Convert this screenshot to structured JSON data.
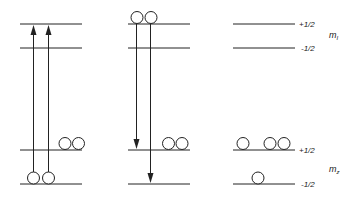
{
  "diagram": {
    "type": "energy-level-diagram",
    "panels": [
      {
        "id": "absorption",
        "levels_y": [
          24,
          48,
          150,
          184
        ],
        "arrows": [
          {
            "direction": "up",
            "from": "bottom",
            "to": "top"
          },
          {
            "direction": "up",
            "from": "bottom",
            "to": "top"
          }
        ],
        "particles": {
          "level_3": 2,
          "level_4": 2
        }
      },
      {
        "id": "emission",
        "levels_y": [
          24,
          48,
          150,
          184
        ],
        "arrows": [
          {
            "direction": "down",
            "from": "top",
            "to": "level_3"
          },
          {
            "direction": "down",
            "from": "top",
            "to": "bottom"
          }
        ],
        "particles": {
          "level_1": 2,
          "level_3": 2
        }
      },
      {
        "id": "populations",
        "levels_y": [
          24,
          48,
          150,
          184
        ],
        "particles": {
          "level_3": 3,
          "level_4": 1
        }
      }
    ],
    "labels": {
      "plus_half_top": "+1/2",
      "minus_half_top": "-1/2",
      "plus_half_bottom": "+1/2",
      "minus_half_bottom": "-1/2",
      "upper_group_symbol": "m",
      "upper_group_subscript": "I",
      "lower_group_symbol": "m",
      "lower_group_subscript": "z"
    },
    "colors": {
      "line": "#222222",
      "background": "#ffffff"
    }
  }
}
